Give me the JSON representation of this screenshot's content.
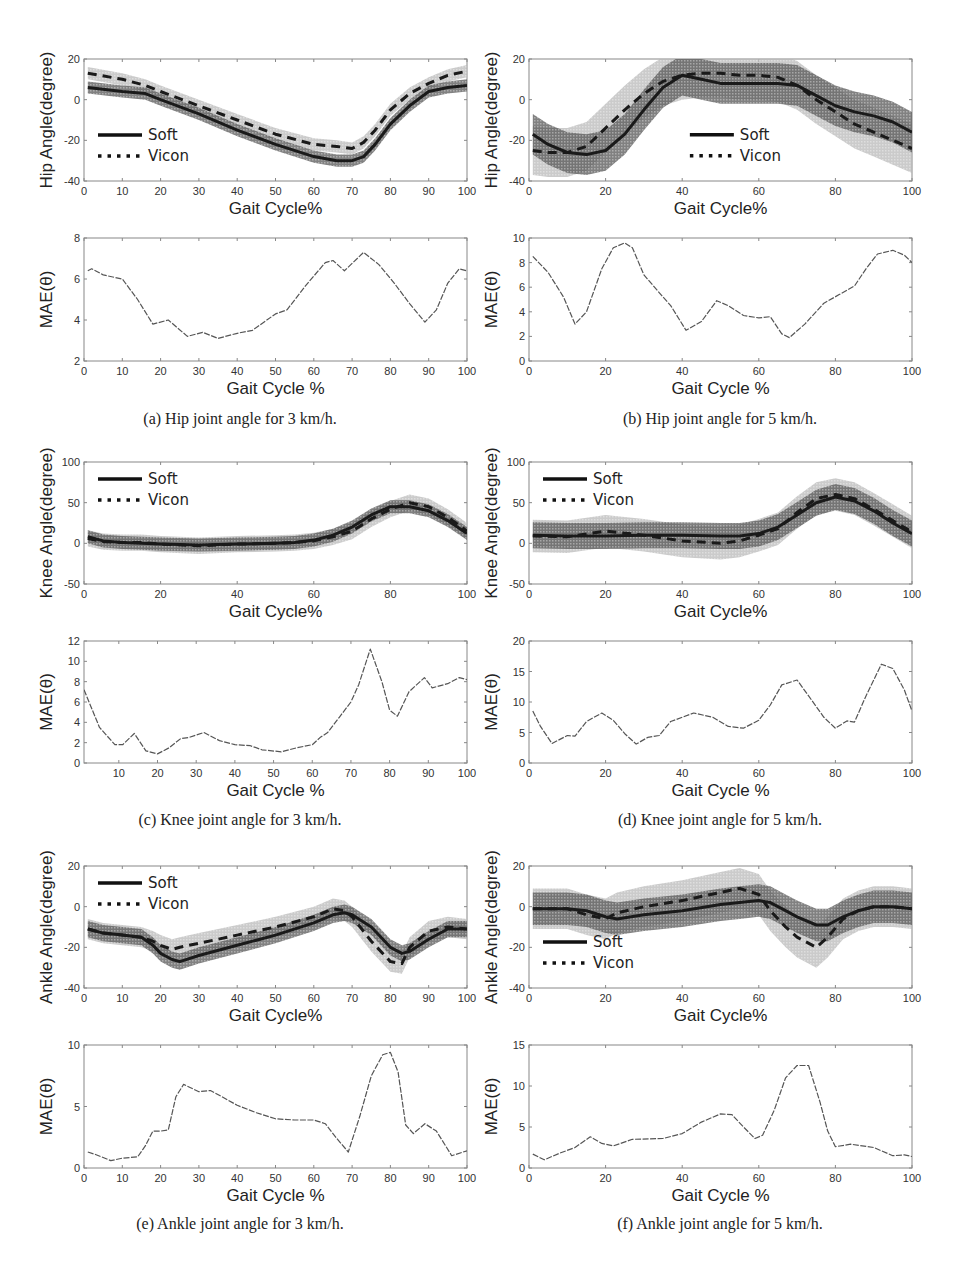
{
  "figure": {
    "legend": {
      "soft": "Soft",
      "vicon": "Vicon"
    },
    "xlabel_angle": "Gait Cycle%",
    "xlabel_mae": "Gait Cycle %",
    "ylabel_mae": "MAE(θ)",
    "colors": {
      "soft_band": "#5a5a5a",
      "vicon_band": "#b8b8b8",
      "line": "#1a1a1a",
      "mae_line": "#555555",
      "axis": "#888888",
      "tick_text": "#333333"
    }
  },
  "captions": [
    "(a) Hip joint angle for 3 km/h.",
    "(b) Hip joint angle for 5 km/h.",
    "(c) Knee joint angle for 3 km/h.",
    "(d) Knee joint angle for 5 km/h.",
    "(e) Ankle joint angle for 3 km/h.",
    "(f) Ankle joint angle for 5 km/h."
  ],
  "chart_data": [
    {
      "id": "a-angle",
      "type": "line",
      "title": "",
      "xlabel": "Gait Cycle%",
      "ylabel": "Hip Angle(degree)",
      "xlim": [
        0,
        100
      ],
      "ylim": [
        -40,
        20
      ],
      "xticks": [
        0,
        10,
        20,
        30,
        40,
        50,
        60,
        70,
        80,
        90,
        100
      ],
      "yticks": [
        -40,
        -20,
        0,
        20
      ],
      "legend_position": "lower-left",
      "x": [
        1,
        10,
        16,
        20,
        30,
        40,
        50,
        60,
        66,
        70,
        73,
        76,
        80,
        85,
        90,
        95,
        100
      ],
      "series": [
        {
          "name": "Soft",
          "values": [
            6,
            4,
            3,
            0,
            -7,
            -15,
            -22,
            -28,
            -30,
            -30,
            -28,
            -22,
            -12,
            -3,
            4,
            6,
            7
          ],
          "band": 3
        },
        {
          "name": "Vicon",
          "values": [
            13,
            10,
            7,
            4,
            -3,
            -10,
            -17,
            -22,
            -23,
            -24,
            -21,
            -15,
            -5,
            3,
            8,
            12,
            14
          ],
          "band": 3
        }
      ]
    },
    {
      "id": "a-mae",
      "type": "line",
      "title": "",
      "xlabel": "Gait Cycle %",
      "ylabel": "MAE(θ)",
      "xlim": [
        0,
        100
      ],
      "ylim": [
        2,
        8
      ],
      "xticks": [
        0,
        10,
        20,
        30,
        40,
        50,
        60,
        70,
        80,
        90,
        100
      ],
      "yticks": [
        2,
        4,
        6,
        8
      ],
      "x": [
        1,
        2,
        5,
        10,
        14,
        18,
        22,
        27,
        31,
        35,
        40,
        44,
        50,
        53,
        58,
        63,
        65,
        68,
        73,
        77,
        81,
        85,
        89,
        92,
        95,
        98,
        100
      ],
      "values": [
        6.4,
        6.5,
        6.2,
        6.0,
        5.0,
        3.8,
        4.0,
        3.2,
        3.4,
        3.1,
        3.35,
        3.5,
        4.3,
        4.5,
        5.7,
        6.8,
        6.9,
        6.4,
        7.3,
        6.7,
        5.8,
        4.8,
        3.9,
        4.5,
        5.8,
        6.5,
        6.4
      ]
    },
    {
      "id": "b-angle",
      "type": "line",
      "title": "",
      "xlabel": "Gait Cycle%",
      "ylabel": "Hip Angle(degree)",
      "xlim": [
        0,
        100
      ],
      "ylim": [
        -40,
        20
      ],
      "xticks": [
        0,
        20,
        40,
        60,
        80,
        100
      ],
      "yticks": [
        -40,
        -20,
        0,
        20
      ],
      "legend_position": "center",
      "x": [
        1,
        5,
        10,
        15,
        20,
        25,
        30,
        35,
        40,
        45,
        50,
        55,
        60,
        65,
        70,
        75,
        80,
        85,
        90,
        95,
        100
      ],
      "series": [
        {
          "name": "Soft",
          "values": [
            -17,
            -22,
            -26,
            -27,
            -25,
            -17,
            -5,
            6,
            12,
            10,
            8,
            8,
            8,
            8,
            7,
            2,
            -3,
            -6,
            -8,
            -11,
            -16
          ],
          "band": 10
        },
        {
          "name": "Vicon",
          "values": [
            -25,
            -26,
            -26,
            -23,
            -14,
            -5,
            3,
            9,
            12,
            13,
            13,
            12,
            12,
            11,
            7,
            0,
            -6,
            -12,
            -16,
            -20,
            -24
          ],
          "band": 12
        }
      ]
    },
    {
      "id": "b-mae",
      "type": "line",
      "title": "",
      "xlabel": "Gait Cycle %",
      "ylabel": "MAE(θ)",
      "xlim": [
        0,
        100
      ],
      "ylim": [
        0,
        10
      ],
      "xticks": [
        0,
        20,
        40,
        60,
        80,
        100
      ],
      "yticks": [
        0,
        2,
        4,
        6,
        8,
        10
      ],
      "x": [
        1,
        5,
        9,
        12,
        15,
        19,
        22,
        25,
        27,
        30,
        35,
        37,
        41,
        45,
        49,
        52,
        56,
        60,
        63,
        66,
        68,
        72,
        77,
        81,
        85,
        88,
        91,
        95,
        98,
        100
      ],
      "values": [
        8.5,
        7.2,
        5.2,
        3.0,
        4.0,
        7.5,
        9.2,
        9.6,
        9.2,
        7.0,
        5.2,
        4.5,
        2.5,
        3.2,
        4.9,
        4.5,
        3.7,
        3.5,
        3.6,
        2.2,
        1.9,
        3.0,
        4.7,
        5.4,
        6.1,
        7.5,
        8.7,
        9.0,
        8.6,
        8.0
      ]
    },
    {
      "id": "c-angle",
      "type": "line",
      "title": "",
      "xlabel": "Gait Cycle%",
      "ylabel": "Knee Angle(degree)",
      "xlim": [
        0,
        100
      ],
      "ylim": [
        -50,
        100
      ],
      "xticks": [
        0,
        20,
        40,
        60,
        80,
        100
      ],
      "yticks": [
        -50,
        0,
        50,
        100
      ],
      "legend_position": "upper-left",
      "x": [
        1,
        5,
        10,
        15,
        20,
        30,
        40,
        50,
        55,
        60,
        65,
        70,
        75,
        80,
        85,
        90,
        95,
        100
      ],
      "series": [
        {
          "name": "Soft",
          "values": [
            8,
            3,
            1,
            0,
            -1,
            -2,
            -1,
            0,
            1,
            4,
            10,
            20,
            35,
            45,
            45,
            40,
            28,
            12
          ],
          "band": 8
        },
        {
          "name": "Vicon",
          "values": [
            6,
            2,
            1,
            1,
            -1,
            -3,
            -1,
            0,
            1,
            3,
            8,
            15,
            30,
            42,
            50,
            45,
            32,
            15
          ],
          "band": 10
        }
      ]
    },
    {
      "id": "c-mae",
      "type": "line",
      "title": "",
      "xlabel": "Gait Cycle %",
      "ylabel": "MAE(θ)",
      "xlim": [
        1,
        100
      ],
      "ylim": [
        0,
        12
      ],
      "xticks": [
        10,
        20,
        30,
        40,
        50,
        60,
        70,
        80,
        90,
        100
      ],
      "yticks": [
        0,
        2,
        4,
        6,
        8,
        10,
        12
      ],
      "x": [
        1,
        5,
        9,
        11,
        14,
        17,
        20,
        23,
        26,
        28,
        32,
        36,
        40,
        44,
        47,
        52,
        56,
        60,
        62,
        64,
        67,
        70,
        72,
        75,
        78,
        80,
        82,
        85,
        89,
        91,
        95,
        98,
        100
      ],
      "values": [
        7.2,
        3.5,
        1.8,
        1.8,
        2.9,
        1.2,
        0.9,
        1.5,
        2.4,
        2.5,
        3.0,
        2.2,
        1.8,
        1.7,
        1.3,
        1.1,
        1.5,
        1.8,
        2.5,
        3.0,
        4.5,
        6.0,
        7.7,
        11.2,
        8.0,
        5.2,
        4.6,
        7.0,
        8.4,
        7.4,
        7.8,
        8.4,
        8.2
      ]
    },
    {
      "id": "d-angle",
      "type": "line",
      "title": "",
      "xlabel": "Gait Cycle%",
      "ylabel": "Knee Angle(degree)",
      "xlim": [
        0,
        100
      ],
      "ylim": [
        -50,
        100
      ],
      "xticks": [
        0,
        20,
        40,
        60,
        80,
        100
      ],
      "yticks": [
        -50,
        0,
        50,
        100
      ],
      "legend_position": "upper-left",
      "x": [
        1,
        10,
        20,
        30,
        40,
        50,
        55,
        60,
        65,
        70,
        75,
        80,
        85,
        90,
        95,
        100
      ],
      "series": [
        {
          "name": "Soft",
          "values": [
            10,
            9,
            9,
            10,
            10,
            9,
            9,
            12,
            20,
            35,
            50,
            57,
            52,
            40,
            25,
            12
          ],
          "band": 16
        },
        {
          "name": "Vicon",
          "values": [
            9,
            8,
            15,
            10,
            3,
            0,
            3,
            10,
            18,
            38,
            55,
            60,
            55,
            42,
            28,
            14
          ],
          "band": 20
        }
      ]
    },
    {
      "id": "d-mae",
      "type": "line",
      "title": "",
      "xlabel": "Gait Cycle %",
      "ylabel": "MAE(θ)",
      "xlim": [
        0,
        100
      ],
      "ylim": [
        0,
        20
      ],
      "xticks": [
        0,
        20,
        40,
        60,
        80,
        100
      ],
      "yticks": [
        0,
        5,
        10,
        15,
        20
      ],
      "x": [
        1,
        3,
        6,
        10,
        12,
        15,
        19,
        22,
        25,
        28,
        31,
        34,
        37,
        43,
        48,
        52,
        56,
        60,
        63,
        66,
        70,
        73,
        77,
        80,
        83,
        85,
        88,
        92,
        95,
        98,
        100
      ],
      "values": [
        8.5,
        6,
        3.2,
        4.5,
        4.4,
        6.8,
        8.2,
        7.0,
        4.8,
        3.1,
        4.2,
        4.5,
        6.8,
        8.2,
        7.5,
        6.0,
        5.7,
        7.0,
        9.5,
        12.8,
        13.6,
        11.0,
        7.5,
        5.7,
        6.9,
        6.7,
        11,
        16.2,
        15.5,
        12,
        8.5
      ]
    },
    {
      "id": "e-angle",
      "type": "line",
      "title": "",
      "xlabel": "Gait Cycle%",
      "ylabel": "Ankle Angle(degree)",
      "xlim": [
        0,
        100
      ],
      "ylim": [
        -40,
        20
      ],
      "xticks": [
        0,
        10,
        20,
        30,
        40,
        50,
        60,
        70,
        80,
        90,
        100
      ],
      "yticks": [
        -40,
        -20,
        0,
        20
      ],
      "legend_position": "upper-left",
      "x": [
        1,
        5,
        10,
        15,
        18,
        20,
        23,
        25,
        30,
        40,
        50,
        60,
        65,
        68,
        70,
        75,
        80,
        83,
        85,
        90,
        95,
        100
      ],
      "series": [
        {
          "name": "Soft",
          "values": [
            -11,
            -13,
            -14,
            -15,
            -19,
            -23,
            -26,
            -27,
            -24,
            -19,
            -14,
            -8,
            -4,
            -3,
            -4,
            -10,
            -20,
            -23,
            -22,
            -16,
            -11,
            -11
          ],
          "band": 4
        },
        {
          "name": "Vicon",
          "values": [
            -11,
            -13,
            -14,
            -15,
            -17,
            -19,
            -21,
            -20,
            -18,
            -14,
            -10,
            -5,
            -1,
            -2,
            -5,
            -17,
            -27,
            -28,
            -20,
            -12,
            -10,
            -11
          ],
          "band": 5
        }
      ]
    },
    {
      "id": "e-mae",
      "type": "line",
      "title": "",
      "xlabel": "Gait Cycle %",
      "ylabel": "MAE(θ)",
      "xlim": [
        0,
        100
      ],
      "ylim": [
        0,
        10
      ],
      "xticks": [
        0,
        10,
        20,
        30,
        40,
        50,
        60,
        70,
        80,
        90,
        100
      ],
      "yticks": [
        0,
        5,
        10
      ],
      "x": [
        1,
        3,
        7,
        10,
        14,
        16,
        18,
        20,
        22,
        24,
        26,
        30,
        33,
        36,
        40,
        45,
        50,
        55,
        60,
        63,
        66,
        69,
        72,
        75,
        78,
        80,
        82,
        84,
        86,
        89,
        92,
        96,
        100
      ],
      "values": [
        1.3,
        1.1,
        0.6,
        0.8,
        0.9,
        1.8,
        3.0,
        3.0,
        3.1,
        5.8,
        6.8,
        6.2,
        6.3,
        5.8,
        5.1,
        4.5,
        4.0,
        3.9,
        3.9,
        3.6,
        2.4,
        1.3,
        4.2,
        7.5,
        9.2,
        9.4,
        7.8,
        3.5,
        2.8,
        3.6,
        3.0,
        1.0,
        1.4
      ]
    },
    {
      "id": "f-angle",
      "type": "line",
      "title": "",
      "xlabel": "Gait Cycle%",
      "ylabel": "Ankle Angle(degree)",
      "xlim": [
        0,
        100
      ],
      "ylim": [
        -40,
        20
      ],
      "xticks": [
        0,
        20,
        40,
        60,
        80,
        100
      ],
      "yticks": [
        -40,
        -20,
        0,
        20
      ],
      "legend_position": "lower-left",
      "x": [
        1,
        10,
        15,
        20,
        23,
        30,
        40,
        50,
        55,
        60,
        63,
        67,
        70,
        75,
        78,
        82,
        86,
        90,
        95,
        100
      ],
      "series": [
        {
          "name": "Soft",
          "values": [
            -1,
            -1,
            -2,
            -5,
            -6,
            -4,
            -2,
            1,
            2,
            3,
            2,
            -2,
            -5,
            -9,
            -9,
            -5,
            -2,
            0,
            0,
            -1
          ],
          "band": 8
        },
        {
          "name": "Vicon",
          "values": [
            -1,
            -1,
            -4,
            -6,
            -3,
            0,
            3,
            7,
            9,
            6,
            -2,
            -10,
            -15,
            -20,
            -15,
            -6,
            -2,
            0,
            0,
            -1
          ],
          "band": 10
        }
      ]
    },
    {
      "id": "f-mae",
      "type": "line",
      "title": "",
      "xlabel": "Gait Cycle %",
      "ylabel": "MAE(θ)",
      "xlim": [
        0,
        100
      ],
      "ylim": [
        0,
        15
      ],
      "xticks": [
        0,
        20,
        40,
        60,
        80,
        100
      ],
      "yticks": [
        0,
        5,
        10,
        15
      ],
      "x": [
        1,
        4,
        8,
        12,
        16,
        19,
        22,
        27,
        35,
        40,
        45,
        50,
        53,
        56,
        59,
        61,
        64,
        67,
        70,
        73,
        76,
        78,
        80,
        84,
        90,
        95,
        98,
        100
      ],
      "values": [
        1.7,
        1.0,
        1.8,
        2.5,
        3.8,
        3.0,
        2.7,
        3.5,
        3.6,
        4.2,
        5.6,
        6.6,
        6.5,
        5.0,
        3.6,
        4.0,
        7.0,
        11.0,
        12.5,
        12.5,
        8.0,
        4.5,
        2.6,
        2.9,
        2.5,
        1.5,
        1.6,
        1.4
      ]
    }
  ]
}
